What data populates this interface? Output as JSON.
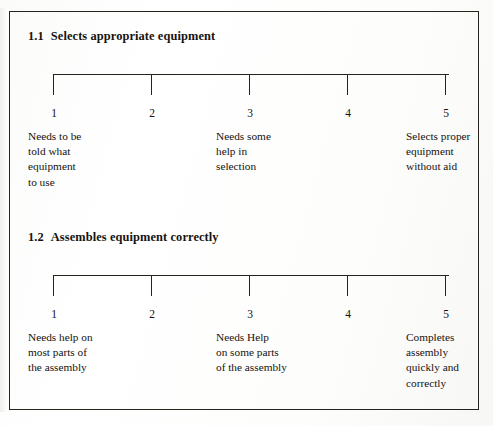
{
  "document": {
    "kind": "rating-scale-form",
    "frame_color": "#26221c",
    "page_background": "#ffffff"
  },
  "scales": [
    {
      "number": "1.1",
      "title": "Selects appropriate equipment",
      "tick_numbers": [
        "1",
        "2",
        "3",
        "4",
        "5"
      ],
      "anchors": {
        "left": "Needs to be\ntold what\nequipment\nto use",
        "middle": "Needs some\nhelp in\nselection",
        "right": "Selects proper\nequipment\nwithout aid"
      }
    },
    {
      "number": "1.2",
      "title": "Assembles equipment correctly",
      "tick_numbers": [
        "1",
        "2",
        "3",
        "4",
        "5"
      ],
      "anchors": {
        "left": "Needs help on\nmost parts of\nthe assembly",
        "middle": "Needs Help\non some parts\nof the assembly",
        "right": "Completes\nassembly\nquickly and\ncorrectly"
      }
    }
  ]
}
